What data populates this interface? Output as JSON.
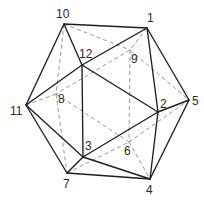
{
  "diagram": {
    "colors": {
      "background": "#ffffff",
      "visible_edge": "#1e1e1e",
      "hidden_edge": "#8a8a8a",
      "label": "#2a2a2a"
    },
    "vertices": [
      {
        "id": "1",
        "x": 147,
        "y": 28,
        "label_x": 147,
        "label_y": 22
      },
      {
        "id": "2",
        "x": 158,
        "y": 112,
        "label_x": 160,
        "label_y": 108
      },
      {
        "id": "3",
        "x": 83,
        "y": 157,
        "label_x": 85,
        "label_y": 150
      },
      {
        "id": "4",
        "x": 150,
        "y": 179,
        "label_x": 146,
        "label_y": 194
      },
      {
        "id": "5",
        "x": 189,
        "y": 100,
        "label_x": 192,
        "label_y": 105
      },
      {
        "id": "6",
        "x": 129,
        "y": 142,
        "label_x": 124,
        "label_y": 155
      },
      {
        "id": "7",
        "x": 67,
        "y": 173,
        "label_x": 63,
        "label_y": 188
      },
      {
        "id": "8",
        "x": 56,
        "y": 94,
        "label_x": 58,
        "label_y": 103
      },
      {
        "id": "9",
        "x": 130,
        "y": 50,
        "label_x": 131,
        "label_y": 63
      },
      {
        "id": "10",
        "x": 64,
        "y": 24,
        "label_x": 56,
        "label_y": 18
      },
      {
        "id": "11",
        "x": 26,
        "y": 105,
        "label_x": 10,
        "label_y": 115
      },
      {
        "id": "12",
        "x": 82,
        "y": 65,
        "label_x": 79,
        "label_y": 58
      }
    ],
    "visible_edges": [
      [
        "10",
        "1"
      ],
      [
        "10",
        "12"
      ],
      [
        "10",
        "11"
      ],
      [
        "1",
        "12"
      ],
      [
        "1",
        "2"
      ],
      [
        "1",
        "5"
      ],
      [
        "12",
        "11"
      ],
      [
        "12",
        "2"
      ],
      [
        "12",
        "3"
      ],
      [
        "11",
        "3"
      ],
      [
        "11",
        "7"
      ],
      [
        "2",
        "3"
      ],
      [
        "2",
        "5"
      ],
      [
        "2",
        "4"
      ],
      [
        "5",
        "4"
      ],
      [
        "3",
        "7"
      ],
      [
        "3",
        "4"
      ],
      [
        "7",
        "4"
      ]
    ],
    "hidden_edges": [
      [
        "10",
        "9"
      ],
      [
        "9",
        "5"
      ],
      [
        "1",
        "9"
      ],
      [
        "9",
        "8"
      ],
      [
        "8",
        "11"
      ],
      [
        "10",
        "8"
      ],
      [
        "8",
        "7"
      ],
      [
        "8",
        "6"
      ],
      [
        "9",
        "6"
      ],
      [
        "7",
        "6"
      ],
      [
        "6",
        "5"
      ],
      [
        "6",
        "4"
      ]
    ]
  }
}
